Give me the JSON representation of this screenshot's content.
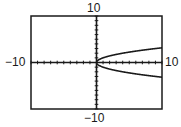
{
  "chart_data": {
    "type": "line",
    "title": "",
    "xlabel": "",
    "ylabel": "",
    "xlim": [
      -10,
      10
    ],
    "ylim": [
      -10,
      10
    ],
    "grid": false,
    "axis_ticks": {
      "x_scale": 1,
      "y_scale": 1
    },
    "tick_labels": {
      "x_min": "−10",
      "x_max": "10",
      "y_min": "−10",
      "y_max": "10"
    },
    "series": [
      {
        "name": "y = √x (upper branch)",
        "x": [
          0,
          0.25,
          1,
          2,
          4,
          6,
          8,
          10
        ],
        "y": [
          0,
          0.5,
          1,
          1.41,
          2,
          2.45,
          2.83,
          3.16
        ]
      },
      {
        "name": "y = −√x (lower branch)",
        "x": [
          0,
          0.25,
          1,
          2,
          4,
          6,
          8,
          10
        ],
        "y": [
          0,
          -0.5,
          -1,
          -1.41,
          -2,
          -2.45,
          -2.83,
          -3.16
        ]
      }
    ],
    "colors": {
      "frame": "#1a1a1a",
      "curve": "#1a1a1a",
      "axes": "#1a1a1a"
    }
  }
}
